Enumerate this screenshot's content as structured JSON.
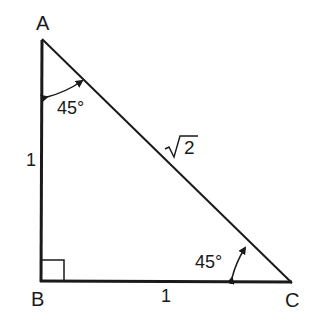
{
  "diagram": {
    "vertices": [
      {
        "label": "A",
        "x": 42,
        "y": 40
      },
      {
        "label": "B",
        "x": 41,
        "y": 281
      },
      {
        "label": "C",
        "x": 290,
        "y": 282
      }
    ],
    "sides": {
      "AB": "1",
      "BC": "1",
      "AC_radicand": "2"
    },
    "angles": {
      "A": "45°",
      "C": "45°",
      "B": "right-angle"
    },
    "colors": {
      "stroke": "#1a1a1a",
      "background": "#ffffff"
    }
  }
}
